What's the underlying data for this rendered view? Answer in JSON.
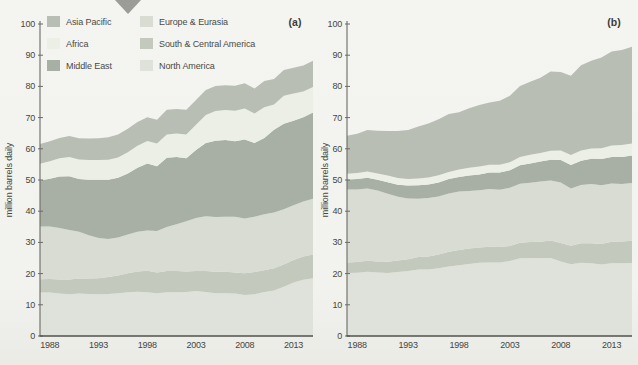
{
  "figure": {
    "background": "#f2f3ef",
    "marker_color": "#9b9b97",
    "axis_color": "#6b6b64",
    "baseline_color": "#52524c",
    "text_color": "#454540",
    "panel_label_color": "#3c3c38"
  },
  "legend": {
    "columns": [
      [
        {
          "label": "Asia Pacific",
          "color": "#b9beb4"
        },
        {
          "label": "Africa",
          "color": "#ecefe6"
        },
        {
          "label": "Middle East",
          "color": "#a8b0a5"
        }
      ],
      [
        {
          "label": "Europe & Eurasia",
          "color": "#d8dcd3"
        },
        {
          "label": "South & Central America",
          "color": "#c3c9bc"
        },
        {
          "label": "North America",
          "color": "#dfe2da"
        }
      ]
    ]
  },
  "chart_data": [
    {
      "id": "a",
      "type": "area",
      "stacked": true,
      "corner_label": "(a)",
      "ylabel": "million barrels daily",
      "ylim": [
        0,
        100
      ],
      "y_ticks": [
        0,
        10,
        20,
        30,
        40,
        50,
        60,
        70,
        80,
        90,
        100
      ],
      "x_tick_labels": [
        "1988",
        "1993",
        "1998",
        "2003",
        "2008",
        "2013"
      ],
      "grid": false,
      "legend_position": "top-left",
      "x_years": [
        1987,
        1988,
        1989,
        1990,
        1991,
        1992,
        1993,
        1994,
        1995,
        1996,
        1997,
        1998,
        1999,
        2000,
        2001,
        2002,
        2003,
        2004,
        2005,
        2006,
        2007,
        2008,
        2009,
        2010,
        2011,
        2012,
        2013,
        2014,
        2015
      ],
      "series": [
        {
          "name": "North America",
          "key": "north-america",
          "color": "#dfe2da",
          "values": [
            13.9,
            13.9,
            13.6,
            13.4,
            13.6,
            13.5,
            13.4,
            13.5,
            13.7,
            14.0,
            14.2,
            14.0,
            13.7,
            14.0,
            14.0,
            14.1,
            14.4,
            14.1,
            13.7,
            13.7,
            13.6,
            13.1,
            13.4,
            14.1,
            14.6,
            15.8,
            17.1,
            18.0,
            18.5
          ]
        },
        {
          "name": "South & Central America",
          "key": "south-central-america",
          "color": "#c3c9bc",
          "values": [
            4.3,
            4.4,
            4.5,
            4.7,
            4.8,
            4.9,
            5.1,
            5.4,
            5.7,
            6.1,
            6.5,
            6.9,
            6.7,
            6.8,
            6.8,
            6.6,
            6.4,
            6.7,
            6.9,
            6.9,
            6.8,
            7.0,
            7.1,
            7.0,
            7.1,
            7.1,
            7.3,
            7.5,
            7.6
          ]
        },
        {
          "name": "Europe & Eurasia",
          "key": "europe-eurasia",
          "color": "#d8dcd3",
          "values": [
            16.9,
            16.8,
            16.5,
            15.9,
            15.0,
            13.9,
            12.9,
            12.2,
            12.2,
            12.4,
            12.7,
            12.9,
            13.3,
            14.1,
            15.0,
            16.1,
            17.0,
            17.6,
            17.5,
            17.6,
            17.8,
            17.6,
            17.7,
            17.9,
            17.9,
            17.7,
            17.5,
            17.6,
            17.9
          ]
        },
        {
          "name": "Middle East",
          "key": "middle-east",
          "color": "#a8b0a5",
          "values": [
            14.7,
            15.3,
            16.5,
            17.2,
            16.9,
            17.8,
            18.7,
            19.0,
            19.1,
            19.6,
            20.5,
            21.5,
            20.7,
            22.2,
            21.6,
            20.2,
            21.8,
            23.5,
            24.5,
            24.6,
            24.2,
            25.3,
            23.7,
            24.5,
            26.5,
            27.4,
            27.1,
            27.0,
            27.6
          ]
        },
        {
          "name": "Africa",
          "key": "africa",
          "color": "#ecefe6",
          "values": [
            5.4,
            5.6,
            5.9,
            6.2,
            6.3,
            6.3,
            6.3,
            6.4,
            6.5,
            6.8,
            7.1,
            7.2,
            7.3,
            7.5,
            7.5,
            7.6,
            8.1,
            8.9,
            9.5,
            9.6,
            9.8,
            9.9,
            9.4,
            9.8,
            8.1,
            9.0,
            8.7,
            8.3,
            8.2
          ]
        },
        {
          "name": "Asia Pacific",
          "key": "asia-pacific",
          "color": "#b9beb4",
          "values": [
            6.3,
            6.4,
            6.5,
            6.7,
            6.8,
            6.9,
            7.0,
            7.2,
            7.4,
            7.5,
            7.6,
            7.6,
            7.6,
            7.9,
            7.9,
            7.9,
            7.9,
            8.0,
            8.0,
            8.0,
            8.0,
            8.1,
            8.0,
            8.4,
            8.2,
            8.3,
            8.3,
            8.3,
            8.4
          ]
        }
      ]
    },
    {
      "id": "b",
      "type": "area",
      "stacked": true,
      "corner_label": "(b)",
      "ylabel": "million barrels daily",
      "ylim": [
        0,
        100
      ],
      "y_ticks": [
        0,
        10,
        20,
        30,
        40,
        50,
        60,
        70,
        80,
        90,
        100
      ],
      "x_tick_labels": [
        "1988",
        "1993",
        "1998",
        "2003",
        "2008",
        "2013"
      ],
      "grid": false,
      "legend_position": "none",
      "x_years": [
        1987,
        1988,
        1989,
        1990,
        1991,
        1992,
        1993,
        1994,
        1995,
        1996,
        1997,
        1998,
        1999,
        2000,
        2001,
        2002,
        2003,
        2004,
        2005,
        2006,
        2007,
        2008,
        2009,
        2010,
        2011,
        2012,
        2013,
        2014,
        2015
      ],
      "series": [
        {
          "name": "North America",
          "key": "north-america",
          "color": "#dfe2da",
          "values": [
            20.2,
            20.3,
            20.6,
            20.4,
            20.2,
            20.5,
            20.8,
            21.3,
            21.3,
            21.7,
            22.3,
            22.7,
            23.1,
            23.5,
            23.6,
            23.6,
            24.0,
            24.9,
            25.0,
            24.9,
            25.0,
            23.9,
            23.0,
            23.5,
            23.3,
            22.9,
            23.3,
            23.3,
            23.4
          ]
        },
        {
          "name": "South & Central America",
          "key": "south-central-america",
          "color": "#c3c9bc",
          "values": [
            3.4,
            3.4,
            3.5,
            3.5,
            3.6,
            3.7,
            3.8,
            4.0,
            4.2,
            4.4,
            4.7,
            4.9,
            4.9,
            4.9,
            5.0,
            4.9,
            4.8,
            5.0,
            5.1,
            5.3,
            5.6,
            5.9,
            5.9,
            6.2,
            6.4,
            6.6,
            6.9,
            7.0,
            7.1
          ]
        },
        {
          "name": "Europe & Eurasia",
          "key": "europe-eurasia",
          "color": "#d8dcd3",
          "values": [
            23.4,
            23.3,
            23.2,
            22.7,
            21.8,
            20.4,
            19.5,
            18.7,
            18.7,
            18.6,
            18.7,
            18.7,
            18.5,
            18.3,
            18.5,
            18.4,
            18.7,
            18.9,
            19.0,
            19.3,
            19.2,
            19.4,
            18.4,
            18.7,
            19.0,
            18.8,
            18.7,
            18.4,
            18.5
          ]
        },
        {
          "name": "Middle East",
          "key": "middle-east",
          "color": "#a8b0a5",
          "values": [
            3.2,
            3.3,
            3.4,
            3.5,
            3.7,
            3.9,
            4.1,
            4.3,
            4.4,
            4.5,
            4.6,
            4.7,
            4.9,
            5.1,
            5.3,
            5.5,
            5.6,
            5.9,
            6.2,
            6.4,
            6.7,
            7.2,
            7.5,
            7.8,
            8.1,
            8.4,
            8.5,
            8.7,
            8.9
          ]
        },
        {
          "name": "Africa",
          "key": "africa",
          "color": "#ecefe6",
          "values": [
            1.8,
            1.9,
            2.0,
            2.0,
            2.1,
            2.1,
            2.1,
            2.2,
            2.2,
            2.3,
            2.3,
            2.4,
            2.5,
            2.5,
            2.5,
            2.5,
            2.6,
            2.7,
            2.8,
            2.8,
            2.9,
            3.1,
            3.2,
            3.3,
            3.3,
            3.5,
            3.7,
            3.8,
            3.8
          ]
        },
        {
          "name": "Asia Pacific",
          "key": "asia-pacific",
          "color": "#b9beb4",
          "values": [
            12.2,
            12.6,
            13.3,
            13.7,
            14.3,
            15.1,
            15.7,
            16.6,
            17.3,
            18.0,
            18.6,
            18.3,
            19.1,
            19.7,
            19.9,
            20.5,
            21.3,
            22.7,
            23.4,
            24.1,
            25.4,
            25.1,
            25.4,
            27.3,
            28.1,
            29.1,
            30.1,
            30.5,
            31.0
          ]
        }
      ]
    }
  ]
}
